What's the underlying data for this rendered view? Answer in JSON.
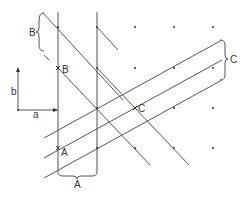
{
  "diagram": {
    "title": "",
    "colors": {
      "line": "#555555",
      "dot": "#333333",
      "background": "#ffffff"
    },
    "labels": {
      "B_bracket": "B",
      "B_point": "B",
      "A_point": "A",
      "A_bracket": "A",
      "C_point": "C",
      "C_bracket": "C",
      "axis_a": "a",
      "axis_b": "b"
    },
    "lattice_dots": [
      [
        58,
        27
      ],
      [
        97,
        27
      ],
      [
        135,
        27
      ],
      [
        174,
        27
      ],
      [
        213,
        27
      ],
      [
        58,
        68
      ],
      [
        97,
        68
      ],
      [
        135,
        68
      ],
      [
        174,
        68
      ],
      [
        213,
        68
      ],
      [
        97,
        108
      ],
      [
        174,
        108
      ],
      [
        213,
        108
      ],
      [
        97,
        148
      ],
      [
        135,
        148
      ],
      [
        174,
        148
      ],
      [
        213,
        148
      ]
    ],
    "marked_points": {
      "B": [
        58,
        68
      ],
      "A": [
        58,
        148
      ],
      "C": [
        135,
        108
      ]
    }
  }
}
